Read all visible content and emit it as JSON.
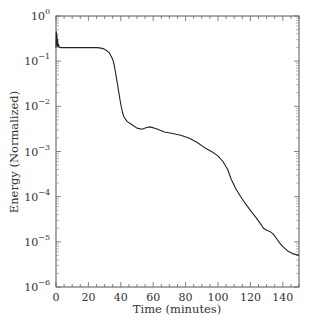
{
  "chart_data": {
    "type": "line",
    "title": "",
    "xlabel": "Time (minutes)",
    "ylabel": "Energy (Normalized)",
    "xlim": [
      0,
      150
    ],
    "ylim": [
      1e-06,
      1
    ],
    "yscale": "log",
    "grid": false,
    "legend": null,
    "x_ticks": [
      0,
      20,
      40,
      60,
      80,
      100,
      120,
      140
    ],
    "x_tick_labels": [
      "0",
      "20",
      "40",
      "60",
      "80",
      "100",
      "120",
      "140"
    ],
    "y_ticks": [
      1,
      0.1,
      0.01,
      0.001,
      0.0001,
      1e-05,
      1e-06
    ],
    "y_tick_labels": [
      {
        "base": "10",
        "exp": "0"
      },
      {
        "base": "10",
        "exp": "−1"
      },
      {
        "base": "10",
        "exp": "−2"
      },
      {
        "base": "10",
        "exp": "−3"
      },
      {
        "base": "10",
        "exp": "−4"
      },
      {
        "base": "10",
        "exp": "−5"
      },
      {
        "base": "10",
        "exp": "−6"
      }
    ],
    "series": [
      {
        "name": "Energy",
        "color": "#222222",
        "x": [
          0,
          0.2,
          0.4,
          0.6,
          0.8,
          1.0,
          1.2,
          1.5,
          2,
          3,
          5,
          10,
          15,
          20,
          25,
          27,
          29,
          31,
          33,
          35,
          36,
          37,
          38,
          39,
          40,
          41,
          42,
          44,
          47,
          50,
          53,
          56,
          58,
          62,
          67,
          72,
          77,
          82,
          87,
          92,
          96,
          100,
          103,
          106,
          108,
          111,
          114,
          117,
          120,
          123,
          126,
          128,
          130,
          132,
          134,
          136,
          138,
          140,
          143,
          146,
          150
        ],
        "y": [
          0.2,
          0.45,
          0.25,
          0.38,
          0.22,
          0.3,
          0.21,
          0.24,
          0.205,
          0.2,
          0.2,
          0.2,
          0.2,
          0.2,
          0.2,
          0.197,
          0.19,
          0.175,
          0.15,
          0.11,
          0.08,
          0.05,
          0.03,
          0.018,
          0.011,
          0.0075,
          0.0058,
          0.0046,
          0.0039,
          0.0033,
          0.0031,
          0.0034,
          0.0035,
          0.0032,
          0.0027,
          0.0025,
          0.0023,
          0.002,
          0.0016,
          0.0012,
          0.001,
          0.0008,
          0.0006,
          0.0004,
          0.00025,
          0.00015,
          0.0001,
          7e-05,
          5e-05,
          3.6e-05,
          2.6e-05,
          2e-05,
          1.8e-05,
          1.7e-05,
          1.5e-05,
          1.2e-05,
          9.5e-06,
          7.8e-06,
          6.3e-06,
          5.5e-06,
          5e-06
        ]
      }
    ]
  }
}
